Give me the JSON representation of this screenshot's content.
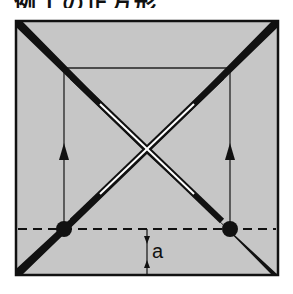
{
  "heading": {
    "text": "例１の正方形",
    "cropped": true
  },
  "diagram": {
    "type": "square-with-diagonals",
    "colors": {
      "fill": "#c6c6c6",
      "stroke": "#111111",
      "background": "#ffffff",
      "highlight": "#ffffff"
    },
    "outer_square": {
      "x1": 16,
      "y1": 21,
      "x2": 278,
      "y2": 275
    },
    "inner_rect_top_y": 68,
    "verticals": [
      {
        "x": 64,
        "arrow": "up"
      },
      {
        "x": 230,
        "arrow": "up"
      }
    ],
    "dashed_line_y": 229,
    "points": [
      {
        "x": 64,
        "y": 229
      },
      {
        "x": 230,
        "y": 229
      }
    ],
    "dimension": {
      "label": "a",
      "x": 147,
      "from_y": 229,
      "to_y": 275
    }
  }
}
